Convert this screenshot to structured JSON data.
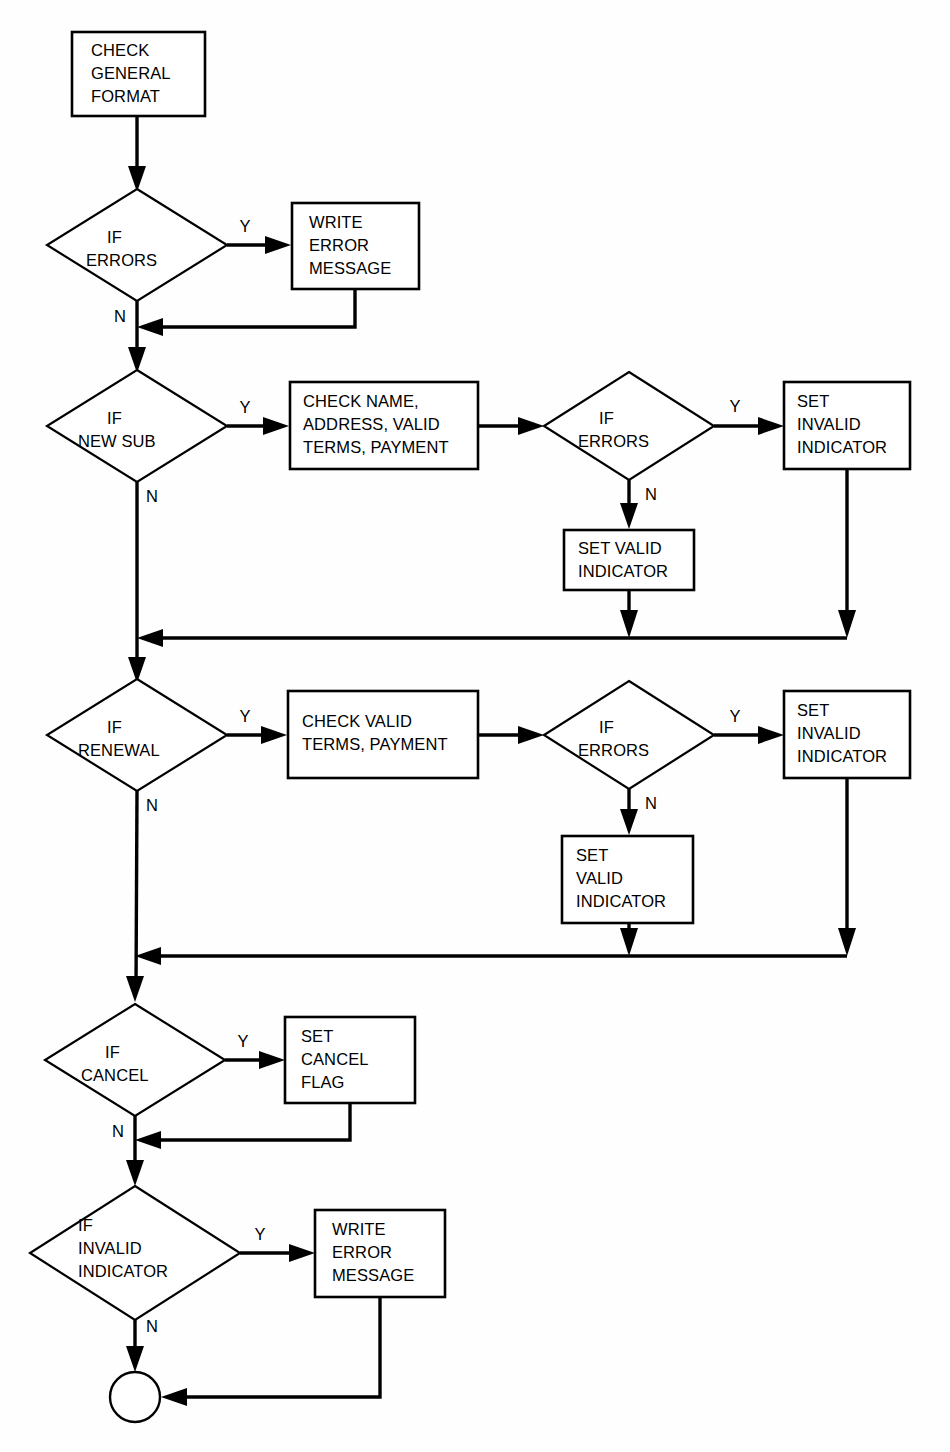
{
  "diagram": {
    "type": "flowchart",
    "background_color": "#ffffff",
    "line_color": "#000000",
    "shape_fill": "#ffffff"
  },
  "nodes": [
    {
      "id": "check-general-format",
      "shape": "process",
      "lines": [
        "CHECK",
        "GENERAL",
        "FORMAT"
      ],
      "x": 72,
      "y": 32,
      "w": 133,
      "h": 84
    },
    {
      "id": "if-errors-1",
      "shape": "decision",
      "lines": [
        "IF",
        "ERRORS"
      ],
      "cx": 137,
      "cy": 245,
      "rx": 90,
      "ry": 56
    },
    {
      "id": "write-error-message-1",
      "shape": "process",
      "lines": [
        "WRITE",
        "ERROR",
        "MESSAGE"
      ],
      "x": 292,
      "y": 203,
      "w": 127,
      "h": 86
    },
    {
      "id": "if-new-sub",
      "shape": "decision",
      "lines": [
        "IF",
        "NEW SUB"
      ],
      "cx": 137,
      "cy": 426,
      "rx": 90,
      "ry": 56
    },
    {
      "id": "check-name-address",
      "shape": "process",
      "lines": [
        "CHECK NAME,",
        "ADDRESS, VALID",
        "TERMS, PAYMENT"
      ],
      "x": 290,
      "y": 382,
      "w": 188,
      "h": 87
    },
    {
      "id": "if-errors-2",
      "shape": "decision",
      "lines": [
        "IF",
        "ERRORS"
      ],
      "cx": 629,
      "cy": 426,
      "rx": 85,
      "ry": 54
    },
    {
      "id": "set-invalid-indicator-1",
      "shape": "process",
      "lines": [
        "SET",
        "INVALID",
        "INDICATOR"
      ],
      "x": 784,
      "y": 382,
      "w": 126,
      "h": 87
    },
    {
      "id": "set-valid-indicator-1",
      "shape": "process",
      "lines": [
        "SET VALID",
        "INDICATOR"
      ],
      "x": 564,
      "y": 530,
      "w": 130,
      "h": 60
    },
    {
      "id": "if-renewal",
      "shape": "decision",
      "lines": [
        "IF",
        "RENEWAL"
      ],
      "cx": 137,
      "cy": 735,
      "rx": 90,
      "ry": 56
    },
    {
      "id": "check-valid-terms",
      "shape": "process",
      "lines": [
        "CHECK VALID",
        "TERMS, PAYMENT"
      ],
      "x": 288,
      "y": 691,
      "w": 190,
      "h": 87
    },
    {
      "id": "if-errors-3",
      "shape": "decision",
      "lines": [
        "IF",
        "ERRORS"
      ],
      "cx": 629,
      "cy": 735,
      "rx": 85,
      "ry": 54
    },
    {
      "id": "set-invalid-indicator-2",
      "shape": "process",
      "lines": [
        "SET",
        "INVALID",
        "INDICATOR"
      ],
      "x": 784,
      "y": 691,
      "w": 126,
      "h": 87
    },
    {
      "id": "set-valid-indicator-2",
      "shape": "process",
      "lines": [
        "SET",
        "VALID",
        "INDICATOR"
      ],
      "x": 562,
      "y": 836,
      "w": 131,
      "h": 87
    },
    {
      "id": "if-cancel",
      "shape": "decision",
      "lines": [
        "IF",
        "CANCEL"
      ],
      "cx": 135,
      "cy": 1060,
      "rx": 90,
      "ry": 56
    },
    {
      "id": "set-cancel-flag",
      "shape": "process",
      "lines": [
        "SET",
        "CANCEL",
        "FLAG"
      ],
      "x": 285,
      "y": 1017,
      "w": 130,
      "h": 86
    },
    {
      "id": "if-invalid-indicator",
      "shape": "decision",
      "lines": [
        "IF",
        "INVALID",
        "INDICATOR"
      ],
      "cx": 135,
      "cy": 1253,
      "rx": 105,
      "ry": 67
    },
    {
      "id": "write-error-message-2",
      "shape": "process",
      "lines": [
        "WRITE",
        "ERROR",
        "MESSAGE"
      ],
      "x": 315,
      "y": 1210,
      "w": 130,
      "h": 87
    },
    {
      "id": "end-connector",
      "shape": "circle",
      "lines": [],
      "cx": 135,
      "cy": 1397,
      "r": 25
    }
  ],
  "edge_labels": [
    {
      "id": "y-errors-1",
      "text": "Y",
      "x": 245,
      "y": 232
    },
    {
      "id": "n-errors-1",
      "text": "N",
      "x": 120,
      "y": 322
    },
    {
      "id": "y-new-sub",
      "text": "Y",
      "x": 245,
      "y": 413
    },
    {
      "id": "n-new-sub",
      "text": "N",
      "x": 152,
      "y": 502
    },
    {
      "id": "y-errors-2",
      "text": "Y",
      "x": 735,
      "y": 412
    },
    {
      "id": "n-errors-2",
      "text": "N",
      "x": 651,
      "y": 500
    },
    {
      "id": "y-renewal",
      "text": "Y",
      "x": 245,
      "y": 722
    },
    {
      "id": "n-renewal",
      "text": "N",
      "x": 152,
      "y": 811
    },
    {
      "id": "y-errors-3",
      "text": "Y",
      "x": 735,
      "y": 722
    },
    {
      "id": "n-errors-3",
      "text": "N",
      "x": 651,
      "y": 809
    },
    {
      "id": "y-cancel",
      "text": "Y",
      "x": 243,
      "y": 1047
    },
    {
      "id": "n-cancel",
      "text": "N",
      "x": 118,
      "y": 1137
    },
    {
      "id": "y-invalid",
      "text": "Y",
      "x": 260,
      "y": 1240
    },
    {
      "id": "n-invalid",
      "text": "N",
      "x": 152,
      "y": 1332
    }
  ]
}
